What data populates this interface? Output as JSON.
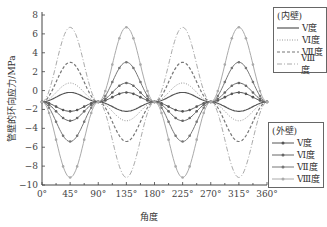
{
  "chart_data": {
    "type": "line",
    "title": "",
    "xlabel": "角度",
    "ylabel": "管壁的环向应力/MPa",
    "xlim": [
      0,
      360
    ],
    "ylim": [
      -10,
      8
    ],
    "x_ticks": [
      "0°",
      "45°",
      "90°",
      "135°",
      "180°",
      "225°",
      "270°",
      "315°",
      "360°"
    ],
    "y_ticks": [
      8,
      6,
      4,
      2,
      0,
      -2,
      -4,
      -6,
      -8,
      -10
    ],
    "grid": false,
    "x": [
      0,
      45,
      90,
      135,
      180,
      225,
      270,
      315,
      360
    ],
    "legend_groups": [
      {
        "title": "(内壁)",
        "entries": [
          "Ⅴ度",
          "Ⅵ度",
          "Ⅶ度",
          "Ⅷ度"
        ]
      },
      {
        "title": "(外壁)",
        "entries": [
          "Ⅴ度",
          "Ⅵ度",
          "Ⅶ度",
          "Ⅷ度"
        ]
      }
    ],
    "series": [
      {
        "name": "内壁 Ⅴ度",
        "values": [
          -1.2,
          -0.2,
          -1.2,
          -2.2,
          -1.2,
          -0.2,
          -1.2,
          -2.2,
          -1.2
        ]
      },
      {
        "name": "内壁 Ⅵ度",
        "values": [
          -1.2,
          0.8,
          -1.2,
          -3.2,
          -1.2,
          0.8,
          -1.2,
          -3.2,
          -1.2
        ]
      },
      {
        "name": "内壁 Ⅶ度",
        "values": [
          -1.2,
          3.0,
          -1.2,
          -5.4,
          -1.2,
          3.0,
          -1.2,
          -5.4,
          -1.2
        ]
      },
      {
        "name": "内壁 Ⅷ度",
        "values": [
          -1.2,
          6.7,
          -1.2,
          -9.2,
          -1.2,
          6.7,
          -1.2,
          -9.2,
          -1.2
        ]
      },
      {
        "name": "外壁 Ⅴ度",
        "values": [
          -1.2,
          -2.2,
          -1.2,
          -0.2,
          -1.2,
          -2.2,
          -1.2,
          -0.2,
          -1.2
        ]
      },
      {
        "name": "外壁 Ⅵ度",
        "values": [
          -1.2,
          -3.2,
          -1.2,
          0.8,
          -1.2,
          -3.2,
          -1.2,
          0.8,
          -1.2
        ]
      },
      {
        "name": "外壁 Ⅶ度",
        "values": [
          -1.2,
          -5.4,
          -1.2,
          3.0,
          -1.2,
          -5.4,
          -1.2,
          3.0,
          -1.2
        ]
      },
      {
        "name": "外壁 Ⅷ度",
        "values": [
          -1.2,
          -9.2,
          -1.2,
          6.7,
          -1.2,
          -9.2,
          -1.2,
          6.7,
          -1.2
        ]
      }
    ]
  },
  "legend_inner": {
    "title": "(内壁)",
    "items": [
      "Ⅴ度",
      "Ⅵ度",
      "Ⅶ度",
      "Ⅷ度"
    ]
  },
  "legend_outer": {
    "title": "(外壁)",
    "items": [
      "Ⅴ度",
      "Ⅵ度",
      "Ⅶ度",
      "Ⅷ度"
    ]
  },
  "axis": {
    "xlabel": "角度",
    "ylabel": "管壁的环向应力/MPa"
  }
}
